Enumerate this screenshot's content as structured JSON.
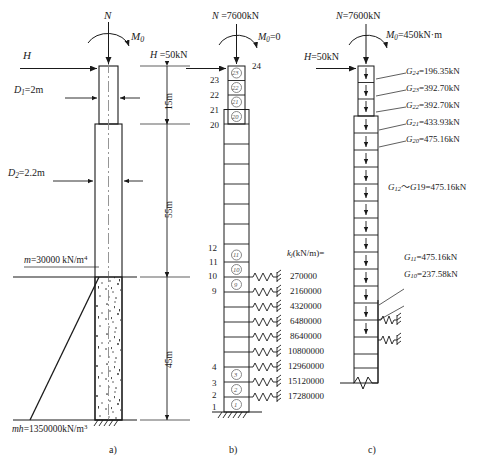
{
  "figure": {
    "captions": [
      {
        "key": "a",
        "label": "a)"
      },
      {
        "key": "b",
        "label": "b)"
      },
      {
        "key": "c",
        "label": "c)"
      }
    ]
  },
  "panel_a": {
    "name": "real-pile-geometry",
    "loads": {
      "axial_symbol": "N",
      "moment_symbol": "M",
      "moment_sub": "0",
      "horizontal_symbol": "H"
    },
    "diameters": [
      {
        "symbol": "D",
        "sub": "1",
        "value": "=2m"
      },
      {
        "symbol": "D",
        "sub": "2",
        "value": "=2.2m"
      }
    ],
    "dimensions": [
      {
        "label": "15m"
      },
      {
        "label": "55m"
      },
      {
        "label": "45m"
      }
    ],
    "soil": {
      "top_label_symbol": "m",
      "top_label_value": "=30000 kN/m",
      "top_label_exp": "4",
      "bottom_label_symbol": "mh",
      "bottom_label_value": "=1350000kN/m",
      "bottom_label_exp": "3"
    }
  },
  "panel_b": {
    "name": "discretized-model",
    "loads": {
      "axial": "N =7600kN",
      "moment_symbol": "M",
      "moment_sub": "0",
      "moment_value": "=0",
      "horizontal": "H =50kN"
    },
    "node_numbers_top": [
      "24",
      "23",
      "22",
      "21",
      "20"
    ],
    "node_numbers_mid": [
      "12",
      "11",
      "10",
      "9"
    ],
    "node_numbers_bottom": [
      "4",
      "3",
      "2",
      "1"
    ],
    "element_numbers_top": [
      "23",
      "22",
      "21",
      "20"
    ],
    "element_numbers_mid": [
      "11",
      "10",
      "9"
    ],
    "element_numbers_bottom": [
      "3",
      "2",
      "1"
    ],
    "spring_header": {
      "symbol": "k",
      "sub": "j",
      "unit": "(kN/m)="
    },
    "spring_values": [
      "270000",
      "2160000",
      "4320000",
      "6480000",
      "8640000",
      "10800000",
      "12960000",
      "15120000",
      "17280000"
    ]
  },
  "panel_c": {
    "name": "equivalent-nodal-loads",
    "loads": {
      "axial": "N=7600kN",
      "moment_symbol": "M",
      "moment_sub": "0",
      "moment_value": "=450kN·m",
      "horizontal": "H=50kN"
    },
    "nodal_forces": [
      {
        "symbol": "G",
        "sub": "24",
        "value": "=196.35kN"
      },
      {
        "symbol": "G",
        "sub": "23",
        "value": "=392.70kN"
      },
      {
        "symbol": "G",
        "sub": "22",
        "value": "=392.70kN"
      },
      {
        "symbol": "G",
        "sub": "21",
        "value": "=433.93kN"
      },
      {
        "symbol": "G",
        "sub": "20",
        "value": "=475.16kN"
      }
    ],
    "range_force": {
      "symbol": "G",
      "sub": "12",
      "tilde": "～",
      "symbol2": "G",
      "sub2": "19",
      "value": "=475.16kN"
    },
    "lower_forces": [
      {
        "symbol": "G",
        "sub": "11",
        "value": "=475.16kN"
      },
      {
        "symbol": "G",
        "sub": "10",
        "value": "=237.58kN"
      }
    ]
  },
  "colors": {
    "line": "#1a1a1a",
    "soil_fill": "#ffffff",
    "speckle": "#2a2a2a",
    "background": "#ffffff"
  }
}
